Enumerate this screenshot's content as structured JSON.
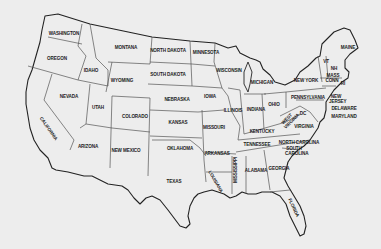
{
  "map": {
    "title": "United States (contiguous) outline map",
    "background_color": "#ededed",
    "line_color": "#333333",
    "states": [
      {
        "id": "WA",
        "label": "WASHINGTON",
        "x": 64,
        "y": 34
      },
      {
        "id": "OR",
        "label": "OREGON",
        "x": 57,
        "y": 59
      },
      {
        "id": "ID",
        "label": "IDAHO",
        "x": 91,
        "y": 71
      },
      {
        "id": "MT",
        "label": "MONTANA",
        "x": 126,
        "y": 48
      },
      {
        "id": "WY",
        "label": "WYOMING",
        "x": 122,
        "y": 81
      },
      {
        "id": "ND",
        "label": "NORTH DAKOTA",
        "x": 168,
        "y": 51
      },
      {
        "id": "SD",
        "label": "SOUTH DAKOTA",
        "x": 168,
        "y": 75
      },
      {
        "id": "MN",
        "label": "MINNESOTA",
        "x": 206,
        "y": 53
      },
      {
        "id": "WI",
        "label": "WISCONSIN",
        "x": 229,
        "y": 71
      },
      {
        "id": "MI",
        "label": "MICHIGAN",
        "x": 262,
        "y": 83
      },
      {
        "id": "NV",
        "label": "NEVADA",
        "x": 69,
        "y": 97
      },
      {
        "id": "UT",
        "label": "UTAH",
        "x": 98,
        "y": 108
      },
      {
        "id": "CO",
        "label": "COLORADO",
        "x": 135,
        "y": 117
      },
      {
        "id": "NE",
        "label": "NEBRASKA",
        "x": 177,
        "y": 100
      },
      {
        "id": "IA",
        "label": "IOWA",
        "x": 210,
        "y": 97
      },
      {
        "id": "IL",
        "label": "ILLINOIS",
        "x": 233,
        "y": 111
      },
      {
        "id": "IN",
        "label": "INDIANA",
        "x": 256,
        "y": 110
      },
      {
        "id": "OH",
        "label": "OHIO",
        "x": 274,
        "y": 105
      },
      {
        "id": "PA",
        "label": "PENNSYLVANIA",
        "x": 308,
        "y": 98
      },
      {
        "id": "NY",
        "label": "NEW YORK",
        "x": 306,
        "y": 81
      },
      {
        "id": "ME",
        "label": "MAINE",
        "x": 348,
        "y": 48
      },
      {
        "id": "VT",
        "label": "VT",
        "x": 328,
        "y": 62
      },
      {
        "id": "NH",
        "label": "NH",
        "x": 334,
        "y": 69
      },
      {
        "id": "MA",
        "label": "MASS",
        "x": 333,
        "y": 76
      },
      {
        "id": "CT",
        "label": "CONN",
        "x": 333,
        "y": 81
      },
      {
        "id": "RI",
        "label": "RI",
        "x": 343,
        "y": 83
      },
      {
        "id": "NJ",
        "label": "NEW JERSEY",
        "x": 334,
        "y": 101
      },
      {
        "id": "DE",
        "label": "DELAWARE",
        "x": 343,
        "y": 109
      },
      {
        "id": "MD",
        "label": "MARYLAND",
        "x": 343,
        "y": 117
      },
      {
        "id": "WV",
        "label": "WEST VIRGINIA",
        "x": 288,
        "y": 121
      },
      {
        "id": "DC",
        "label": "DC",
        "x": 303,
        "y": 114
      },
      {
        "id": "VA",
        "label": "VIRGINIA",
        "x": 304,
        "y": 127
      },
      {
        "id": "KY",
        "label": "KENTUCKY",
        "x": 262,
        "y": 132
      },
      {
        "id": "MO",
        "label": "MISSOURI",
        "x": 214,
        "y": 128
      },
      {
        "id": "KS",
        "label": "KANSAS",
        "x": 178,
        "y": 123
      },
      {
        "id": "CA",
        "label": "CALIFORNIA",
        "x": 48,
        "y": 129
      },
      {
        "id": "AZ",
        "label": "ARIZONA",
        "x": 88,
        "y": 147
      },
      {
        "id": "NM",
        "label": "NEW MEXICO",
        "x": 126,
        "y": 151
      },
      {
        "id": "OK",
        "label": "OKLAHOMA",
        "x": 180,
        "y": 149
      },
      {
        "id": "AR",
        "label": "ARKANSAS",
        "x": 217,
        "y": 154
      },
      {
        "id": "TN",
        "label": "TENNESSEE",
        "x": 257,
        "y": 145
      },
      {
        "id": "NC",
        "label": "NORTH CAROLINA",
        "x": 299,
        "y": 143
      },
      {
        "id": "SC",
        "label": "SOUTH CAROLINA",
        "x": 294,
        "y": 152
      },
      {
        "id": "TX",
        "label": "TEXAS",
        "x": 174,
        "y": 182
      },
      {
        "id": "LA",
        "label": "LOUISIANA",
        "x": 215,
        "y": 182
      },
      {
        "id": "MS",
        "label": "MISSISSIPPI",
        "x": 236,
        "y": 170
      },
      {
        "id": "AL",
        "label": "ALABAMA",
        "x": 256,
        "y": 171
      },
      {
        "id": "GA",
        "label": "GEORGIA",
        "x": 279,
        "y": 169
      },
      {
        "id": "FL",
        "label": "FLORIDA",
        "x": 293,
        "y": 208
      }
    ]
  }
}
